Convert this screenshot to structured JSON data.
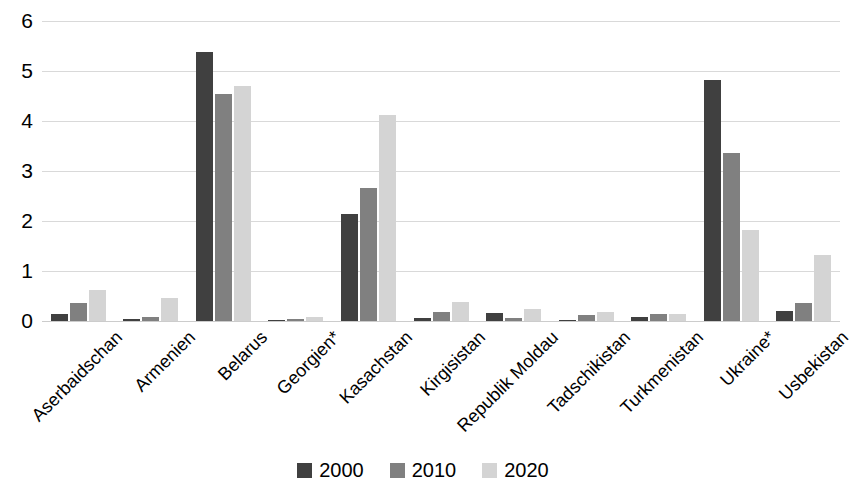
{
  "chart_data": {
    "type": "bar",
    "title": "",
    "subtitle": "",
    "xlabel": "",
    "ylabel": "",
    "ylim": [
      0,
      6
    ],
    "y_ticks": [
      0,
      1,
      2,
      3,
      4,
      5,
      6
    ],
    "grid": true,
    "legend_position": "bottom",
    "categories": [
      "Aserbaidschan",
      "Armenien",
      "Belarus",
      "Georgien*",
      "Kasachstan",
      "Kirgisistan",
      "Republik Moldau",
      "Tadschikistan",
      "Turkmenistan",
      "Ukraine*",
      "Usbekistan"
    ],
    "series": [
      {
        "name": "2000",
        "color": "#404040",
        "values": [
          0.14,
          0.04,
          5.38,
          0.01,
          2.15,
          0.07,
          0.17,
          0.02,
          0.09,
          4.82,
          0.21
        ]
      },
      {
        "name": "2010",
        "color": "#808080",
        "values": [
          0.37,
          0.09,
          4.54,
          0.04,
          2.66,
          0.19,
          0.06,
          0.13,
          0.14,
          3.37,
          0.36
        ]
      },
      {
        "name": "2020",
        "color": "#d4d4d4",
        "values": [
          0.63,
          0.47,
          4.7,
          0.09,
          4.12,
          0.39,
          0.25,
          0.18,
          0.14,
          1.82,
          1.32
        ]
      }
    ]
  },
  "legend": {
    "items": [
      {
        "label": "2000",
        "color": "#404040"
      },
      {
        "label": "2010",
        "color": "#808080"
      },
      {
        "label": "2020",
        "color": "#d4d4d4"
      }
    ]
  }
}
